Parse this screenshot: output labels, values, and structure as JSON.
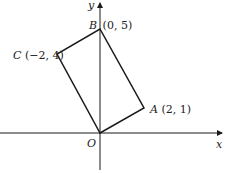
{
  "diagram": {
    "type": "coordinate-geometry",
    "axes": {
      "x_label": "x",
      "y_label": "y",
      "origin_label": "O"
    },
    "points": [
      {
        "name": "O",
        "coords": ""
      },
      {
        "name": "A",
        "coords": "(2, 1)"
      },
      {
        "name": "B",
        "coords": "(0, 5)"
      },
      {
        "name": "C",
        "coords": "(−2, 4)"
      }
    ],
    "shape": "rectangle OABC",
    "colors": {
      "line": "#1a1a1a",
      "background": "#ffffff"
    }
  }
}
